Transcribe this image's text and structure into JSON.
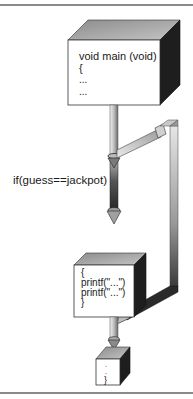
{
  "diagram": {
    "type": "flow",
    "blocks": [
      {
        "id": "main",
        "lines": [
          "void main (void)",
          "{",
          "...",
          "..."
        ]
      },
      {
        "id": "if-body",
        "lines": [
          "{",
          "printf(\"...\")",
          "printf(\"...\")",
          "}"
        ]
      },
      {
        "id": "end",
        "lines": [
          ".",
          ".",
          "}"
        ]
      }
    ],
    "condition_label": "if(guess==jackpot)",
    "connections": [
      {
        "from": "main",
        "to": "if-body",
        "label": "if(guess==jackpot)"
      },
      {
        "from": "main",
        "to": "end",
        "label": "bypass (false branch)"
      },
      {
        "from": "if-body",
        "to": "end",
        "label": ""
      }
    ],
    "colors": {
      "box_face": "#ffffff",
      "box_top": "#a8a8a8",
      "box_side": "#1e1e1e",
      "pipe_light": "#d8d8d8",
      "pipe_dark": "#2a2a2a",
      "frame": "#8a8a8a"
    }
  }
}
